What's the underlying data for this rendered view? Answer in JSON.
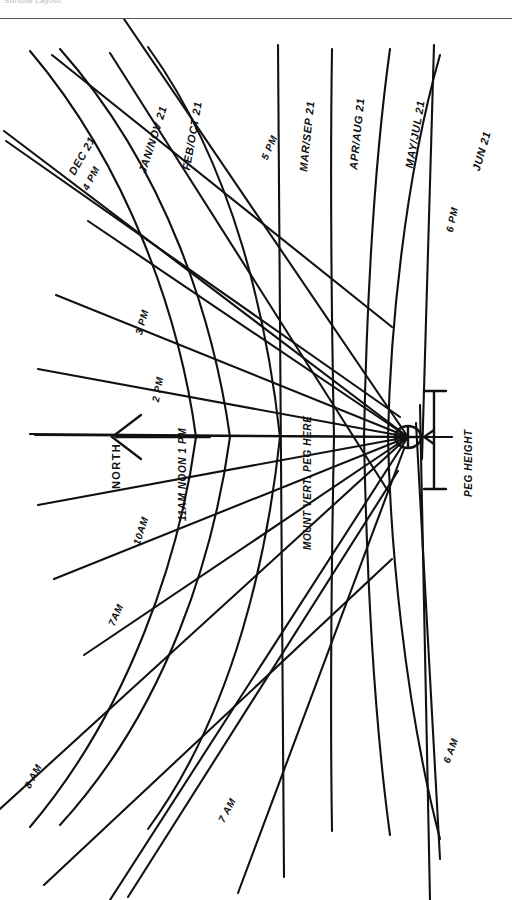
{
  "header": {
    "title": "Sundial Layout"
  },
  "diagram": {
    "orientation_note": "Drawing rotated 90 degrees; lettering reads bottom-to-top",
    "north_label": "NORTH",
    "mount_label": "MOUNT VERT. PEG HERE",
    "peg_height_label": "PEG HEIGHT",
    "ink_color": "#111111",
    "paper_color": "#ffffff"
  },
  "hour_lines": [
    {
      "id": "h6am",
      "label": "6 AM"
    },
    {
      "id": "h7am",
      "label": "7 AM"
    },
    {
      "id": "h8am",
      "label": "8 AM"
    },
    {
      "id": "h7am2",
      "label": "7 AM"
    },
    {
      "id": "h10am",
      "label": "10AM"
    },
    {
      "id": "h11am",
      "label": "11 AM"
    },
    {
      "id": "hnoon",
      "label": "NOON"
    },
    {
      "id": "h1pm",
      "label": "1 PM"
    },
    {
      "id": "h2pm",
      "label": "2 PM"
    },
    {
      "id": "h3pm",
      "label": "3 PM"
    },
    {
      "id": "h4pm",
      "label": "4 PM"
    },
    {
      "id": "h5pm",
      "label": "5 PM"
    },
    {
      "id": "h6pm",
      "label": "6 PM"
    }
  ],
  "declination_curves": [
    {
      "id": "dec",
      "label": "DEC 21"
    },
    {
      "id": "jannov",
      "label": "JAN/NOV 21"
    },
    {
      "id": "feboct",
      "label": "FEB/OCT 21"
    },
    {
      "id": "marsep",
      "label": "MAR/SEP 21"
    },
    {
      "id": "apraug",
      "label": "APR/AUG 21"
    },
    {
      "id": "mayjul",
      "label": "MAY/JUL 21"
    },
    {
      "id": "jun",
      "label": "JUN 21"
    }
  ],
  "labels": {
    "dec21": "DEC 21",
    "pm4": "4 PM",
    "jan_nov": "JAN/NOV 21",
    "feb_oct": "FEB/OCT 21",
    "pm5": "5 PM",
    "mar_sep": "MAR/SEP 21",
    "apr_aug": "APR/AUG 21",
    "may_jul": "MAY/JUL 21",
    "pm6": "6 PM",
    "jun21": "JUN 21",
    "pm3": "3 PM",
    "pm2": "2 PM",
    "noon_1pm": "11AM NOON 1 PM",
    "am10": "10AM",
    "am7": "7AM",
    "am8": "8 AM",
    "am7b": "7 AM",
    "am6": "6 AM",
    "north": "NORTH",
    "mount": "MOUNT VERT. PEG HERE",
    "peg_height": "PEG HEIGHT"
  }
}
